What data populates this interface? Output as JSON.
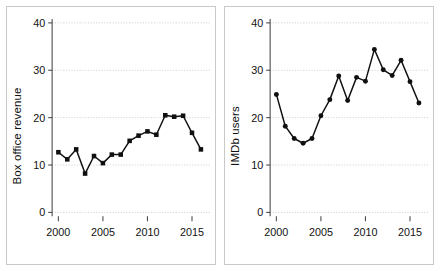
{
  "figure": {
    "panels": [
      {
        "id": "box-office-revenue",
        "ylabel": "Box office revenue",
        "yticks": [
          "0",
          "10",
          "20",
          "30",
          "40"
        ],
        "xticks": [
          "2000",
          "2005",
          "2010",
          "2015"
        ]
      },
      {
        "id": "imdb-users",
        "ylabel": "IMDb users",
        "yticks": [
          "0",
          "10",
          "20",
          "30",
          "40"
        ],
        "xticks": [
          "2000",
          "2005",
          "2010",
          "2015"
        ]
      }
    ]
  },
  "chart_data": [
    {
      "type": "line",
      "id": "box-office-revenue",
      "title": "",
      "xlabel": "",
      "ylabel": "Box office revenue",
      "xlim": [
        1999.3,
        2016.7
      ],
      "ylim": [
        0,
        40
      ],
      "xticks": [
        2000,
        2005,
        2010,
        2015
      ],
      "yticks": [
        0,
        10,
        20,
        30,
        40
      ],
      "grid": true,
      "legend": null,
      "marker": "square",
      "color": "#101010",
      "x": [
        2000,
        2001,
        2002,
        2003,
        2004,
        2005,
        2006,
        2007,
        2008,
        2009,
        2010,
        2011,
        2012,
        2013,
        2014,
        2015,
        2016
      ],
      "values": [
        12.7,
        11.2,
        13.3,
        8.2,
        11.9,
        10.4,
        12.2,
        12.2,
        15.1,
        16.2,
        17.1,
        16.4,
        20.5,
        20.2,
        20.4,
        16.8,
        13.3
      ],
      "y_extra_note": ""
    },
    {
      "type": "line",
      "id": "imdb-users",
      "title": "",
      "xlabel": "",
      "ylabel": "IMDb users",
      "xlim": [
        1999.3,
        2016.7
      ],
      "ylim": [
        0,
        40
      ],
      "xticks": [
        2000,
        2005,
        2010,
        2015
      ],
      "yticks": [
        0,
        10,
        20,
        30,
        40
      ],
      "grid": true,
      "legend": null,
      "marker": "circle",
      "color": "#101010",
      "x": [
        2000,
        2001,
        2002,
        2003,
        2004,
        2005,
        2006,
        2007,
        2008,
        2009,
        2010,
        2011,
        2012,
        2013,
        2014,
        2015,
        2016
      ],
      "values": [
        24.9,
        18.2,
        15.6,
        14.6,
        15.6,
        20.4,
        23.8,
        28.8,
        23.6,
        28.5,
        27.7,
        34.4,
        30.1,
        28.9,
        32.1,
        27.6,
        23.1
      ]
    }
  ]
}
